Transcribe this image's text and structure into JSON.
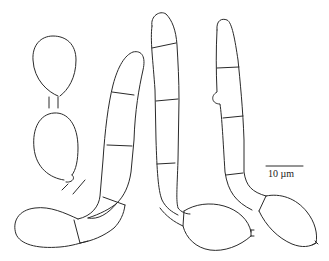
{
  "figure": {
    "scale_bar": {
      "label": "10 µm"
    },
    "colors": {
      "stroke": "#2a2a2a",
      "background": "#ffffff"
    }
  }
}
